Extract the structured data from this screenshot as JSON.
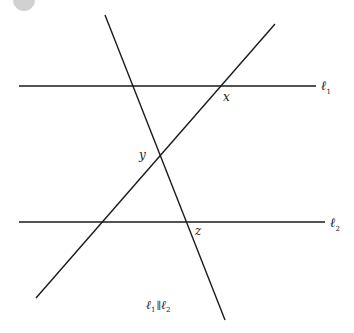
{
  "figure": {
    "type": "parallel lines cut by transversals",
    "lines": {
      "l1": {
        "label": "ℓ",
        "sub": "1",
        "y": 86
      },
      "l2": {
        "label": "ℓ",
        "sub": "2",
        "y": 222
      }
    },
    "transversals": [
      {
        "name": "steep-transversal",
        "from": [
          105,
          15
        ],
        "to": [
          225,
          320
        ]
      },
      {
        "name": "rising-transversal",
        "from": [
          275,
          24
        ],
        "to": [
          36,
          298
        ]
      }
    ],
    "angle_labels": {
      "x": "x",
      "y": "y",
      "z": "z"
    },
    "caption": {
      "l1": "ℓ",
      "sub1": "1",
      "parallel": "∥",
      "l2": "ℓ",
      "sub2": "2"
    },
    "colors": {
      "line": "#1a1a1a",
      "marker": "#c8c8c8"
    }
  }
}
